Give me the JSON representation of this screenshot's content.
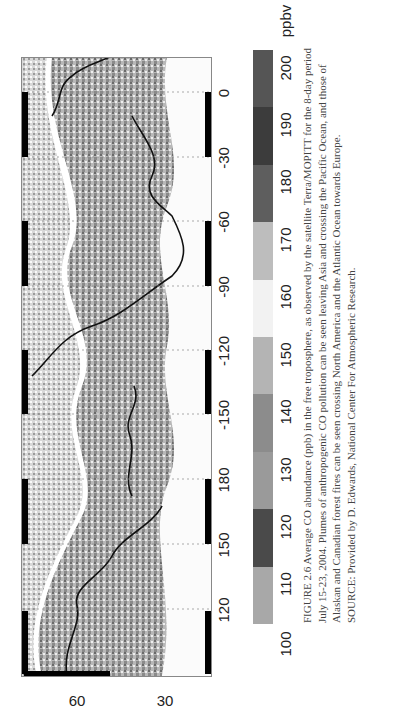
{
  "figure": {
    "map": {
      "longitude_ticks": [
        "120",
        "150",
        "180",
        "-150",
        "-120",
        "-90",
        "-60",
        "-30",
        "0"
      ],
      "latitude_ticks": [
        "60",
        "30"
      ],
      "description": "Grayscale map of average CO abundance over the Northern Hemisphere (Asia, Pacific, North America, Atlantic, Europe)"
    },
    "colorbar": {
      "ticks": [
        "100",
        "110",
        "120",
        "130",
        "140",
        "150",
        "160",
        "170",
        "180",
        "190",
        "200"
      ],
      "unit": "ppbv",
      "colors": [
        "#a8a8a8",
        "#4a4a4a",
        "#9a9a9a",
        "#8c8c8c",
        "#b4b4b4",
        "#f2f2f2",
        "#bdbdbd",
        "#5e5e5e",
        "#3c3c3c",
        "#555555"
      ]
    },
    "caption": {
      "line1": "FIGURE 2.6  Average CO abundance (ppb) in the free troposphere, as observed by the satellite Terra/MOPITT for the 8-day period",
      "line2": "July 15-23, 2004. Plumes of anthropogenic CO pollution can be seen leaving Asia and crossing the Pacific Ocean, and those of",
      "line3": "Alaskan and Canadian forest fires can be seen crossing North America and the Atlantic Ocean towards Europe.",
      "source": "SOURCE: Provided by D. Edwards, National Center For Atmospheric Research."
    }
  }
}
